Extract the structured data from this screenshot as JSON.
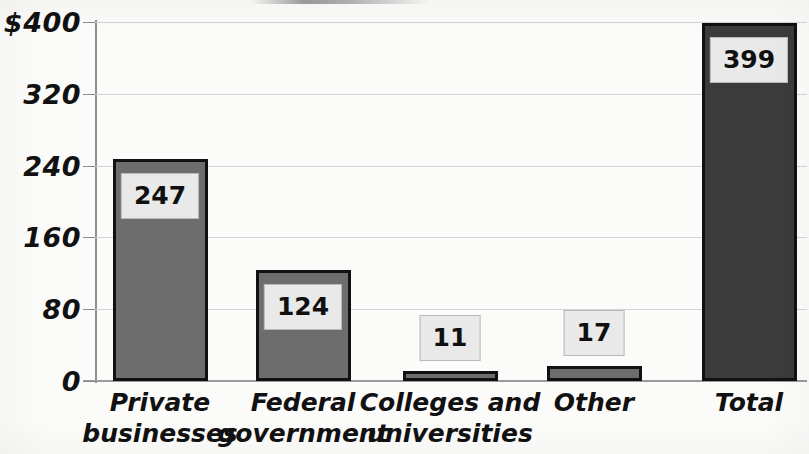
{
  "chart_data": {
    "type": "bar",
    "title": "",
    "xlabel": "",
    "ylabel": "",
    "ylim": [
      0,
      400
    ],
    "yticks": [
      0,
      80,
      160,
      240,
      320,
      400
    ],
    "ytick_labels": [
      "0",
      "80",
      "160",
      "240",
      "320",
      "$400"
    ],
    "grid": true,
    "legend": "none",
    "units": "dollars (billions)",
    "categories": [
      "Private businesses",
      "Federal government",
      "Colleges and universities",
      "Other",
      "Total"
    ],
    "category_lines": [
      [
        "Private",
        "businesses"
      ],
      [
        "Federal",
        "government"
      ],
      [
        "Colleges and",
        "universities"
      ],
      [
        "Other",
        ""
      ],
      [
        "Total",
        ""
      ]
    ],
    "values": [
      247,
      124,
      11,
      17,
      399
    ],
    "value_labels": [
      "247",
      "124",
      "11",
      "17",
      "399"
    ],
    "bar_colors": [
      "#6d6d6d",
      "#6d6d6d",
      "#6d6d6d",
      "#6d6d6d",
      "#3b3b3b"
    ],
    "label_placement": [
      "inside-top",
      "inside-top",
      "above",
      "above",
      "inside-top"
    ]
  },
  "style": {
    "bar_fill_standard": "#6d6d6d",
    "bar_fill_total": "#3b3b3b",
    "bar_outline": "#111111",
    "gridline_color": "#d3d3d3",
    "axis_color": "#8f8f8f",
    "value_box_fill": "#e9e9e9",
    "value_box_border": "#b9b9b9",
    "text_color": "#111111",
    "background": "#fbfbfa"
  },
  "geometry": {
    "plot_left": 95,
    "plot_top": 22,
    "plot_width": 712,
    "plot_height": 359,
    "bar_width": 95,
    "bar_centers": [
      160,
      303,
      450,
      594,
      749
    ]
  }
}
